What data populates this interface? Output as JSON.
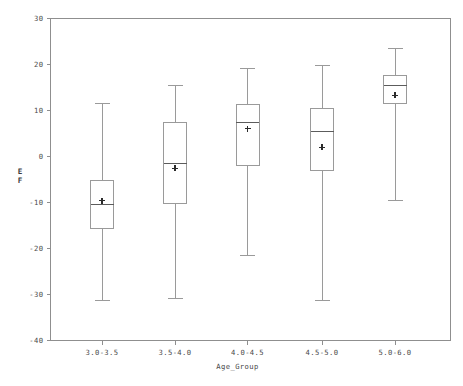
{
  "chart_data": {
    "type": "box",
    "title": "",
    "xlabel": "Age_Group",
    "ylabel": "EF",
    "ylabel_lines": [
      "E",
      "F"
    ],
    "categories": [
      "3.0-3.5",
      "3.5-4.0",
      "4.0-4.5",
      "4.5-5.0",
      "5.0-6.0"
    ],
    "ylim": [
      -40,
      30
    ],
    "yticks": [
      30,
      20,
      10,
      0,
      -10,
      -20,
      -30,
      -40
    ],
    "ytick_labels": [
      "30",
      "20",
      "10",
      "0",
      "-10",
      "-20",
      "-30",
      "-40"
    ],
    "grid": false,
    "legend": "none",
    "box_stats": [
      {
        "category": "3.0-3.5",
        "whisker_low": -31.3,
        "q1": -15.7,
        "median": -10.5,
        "q3": -5.2,
        "whisker_high": 11.5,
        "mean": -9.6
      },
      {
        "category": "3.5-4.0",
        "whisker_low": -30.9,
        "q1": -10.2,
        "median": -1.5,
        "q3": 7.5,
        "whisker_high": 15.4,
        "mean": -2.6
      },
      {
        "category": "4.0-4.5",
        "whisker_low": -21.5,
        "q1": -2.0,
        "median": 7.4,
        "q3": 11.3,
        "whisker_high": 19.1,
        "mean": 6.0
      },
      {
        "category": "4.5-5.0",
        "whisker_low": -31.3,
        "q1": -3.0,
        "median": 5.4,
        "q3": 10.4,
        "whisker_high": 19.8,
        "mean": 2.0
      },
      {
        "category": "5.0-6.0",
        "whisker_low": -9.6,
        "q1": 11.5,
        "median": 15.4,
        "q3": 17.6,
        "whisker_high": 23.5,
        "mean": 13.3
      }
    ]
  },
  "colors": {
    "background": "#ffffff",
    "frame": "#8f8f8f",
    "box_stroke": "#9a9a9a",
    "median": "#5c5c5c",
    "mean": "#2b2b2b",
    "text": "#4a4a4a"
  }
}
